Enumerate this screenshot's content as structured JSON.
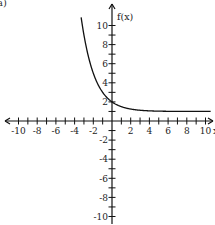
{
  "corner_label": "a)",
  "chart_data": {
    "type": "line",
    "title": "",
    "xlabel": "x",
    "ylabel": "f(x)",
    "xlim": [
      -10.5,
      10.5
    ],
    "ylim": [
      -11,
      11.5
    ],
    "grid": false,
    "legend": null,
    "x_ticks": [
      -10,
      -8,
      -6,
      -4,
      -2,
      2,
      4,
      6,
      8,
      10
    ],
    "x_tick_labels": [
      "-10",
      "-8",
      "-6",
      "-4",
      "-2",
      "2",
      "4",
      "6",
      "8",
      "10"
    ],
    "y_ticks": [
      -10,
      -8,
      -6,
      -4,
      -2,
      2,
      4,
      6,
      8,
      10
    ],
    "y_tick_labels": [
      "-10",
      "-8",
      "-6",
      "-4",
      "-2",
      "2",
      "4",
      "6",
      "8",
      "10"
    ],
    "minor_tick_step": 1,
    "series": [
      {
        "name": "f(x)",
        "function": "(1/2)^x + 1",
        "x": [
          -3.3,
          -3,
          -2.5,
          -2,
          -1.5,
          -1,
          -0.5,
          0,
          0.5,
          1,
          2,
          3,
          4,
          5,
          6,
          8,
          10.5
        ],
        "values": [
          10.85,
          9,
          6.66,
          5,
          3.83,
          3,
          2.41,
          2,
          1.71,
          1.5,
          1.25,
          1.125,
          1.06,
          1.03,
          1.016,
          1.004,
          1.0007
        ]
      }
    ],
    "asymptote": {
      "type": "horizontal",
      "y": 1
    },
    "annotations": []
  }
}
